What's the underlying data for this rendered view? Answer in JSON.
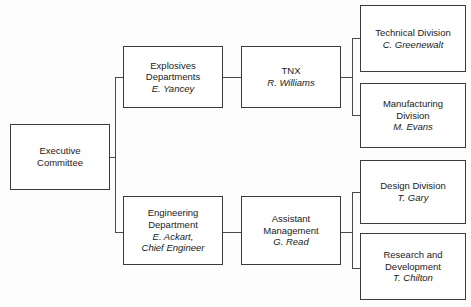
{
  "chart_data": {
    "type": "diagram",
    "diagram_kind": "organizational-chart",
    "title": "",
    "orientation": "left-to-right",
    "levels": 4,
    "nodes": [
      {
        "id": "executive-committee",
        "lines": [
          {
            "text": "Executive",
            "style": "regular"
          },
          {
            "text": "Committee",
            "style": "regular"
          }
        ],
        "level": 1,
        "box": {
          "x": 10,
          "y": 124,
          "w": 100,
          "h": 66
        }
      },
      {
        "id": "explosives-departments",
        "lines": [
          {
            "text": "Explosives",
            "style": "regular"
          },
          {
            "text": "Departments",
            "style": "regular"
          },
          {
            "text": "E. Yancey",
            "style": "italic"
          }
        ],
        "level": 2,
        "box": {
          "x": 123,
          "y": 46,
          "w": 100,
          "h": 62
        }
      },
      {
        "id": "engineering-department",
        "lines": [
          {
            "text": "Engineering",
            "style": "regular"
          },
          {
            "text": "Department",
            "style": "regular"
          },
          {
            "text": "E. Ackart,",
            "style": "italic"
          },
          {
            "text": "Chief Engineer",
            "style": "italic"
          }
        ],
        "level": 2,
        "box": {
          "x": 123,
          "y": 196,
          "w": 100,
          "h": 69
        }
      },
      {
        "id": "tnx",
        "lines": [
          {
            "text": "TNX",
            "style": "regular"
          },
          {
            "text": "R. Williams",
            "style": "italic"
          }
        ],
        "level": 3,
        "box": {
          "x": 241,
          "y": 46,
          "w": 100,
          "h": 62
        }
      },
      {
        "id": "assistant-management",
        "lines": [
          {
            "text": "Assistant",
            "style": "regular"
          },
          {
            "text": "Management",
            "style": "regular"
          },
          {
            "text": "G. Read",
            "style": "italic"
          }
        ],
        "level": 3,
        "box": {
          "x": 241,
          "y": 196,
          "w": 100,
          "h": 69
        }
      },
      {
        "id": "technical-division",
        "lines": [
          {
            "text": "Technical Division",
            "style": "regular"
          },
          {
            "text": "C. Greenewalt",
            "style": "italic"
          }
        ],
        "level": 4,
        "box": {
          "x": 360,
          "y": 5,
          "w": 106,
          "h": 67
        }
      },
      {
        "id": "manufacturing-division",
        "lines": [
          {
            "text": "Manufacturing",
            "style": "regular"
          },
          {
            "text": "Division",
            "style": "regular"
          },
          {
            "text": "M. Evans",
            "style": "italic"
          }
        ],
        "level": 4,
        "box": {
          "x": 360,
          "y": 83,
          "w": 106,
          "h": 65
        }
      },
      {
        "id": "design-division",
        "lines": [
          {
            "text": "Design Division",
            "style": "regular"
          },
          {
            "text": "T. Gary",
            "style": "italic"
          }
        ],
        "level": 4,
        "box": {
          "x": 360,
          "y": 160,
          "w": 106,
          "h": 64
        }
      },
      {
        "id": "research-and-development",
        "lines": [
          {
            "text": "Research and",
            "style": "regular"
          },
          {
            "text": "Development",
            "style": "regular"
          },
          {
            "text": "T. Chilton",
            "style": "italic"
          }
        ],
        "level": 4,
        "box": {
          "x": 360,
          "y": 233,
          "w": 106,
          "h": 67
        }
      }
    ],
    "edges": [
      {
        "from": "executive-committee",
        "to": "explosives-departments"
      },
      {
        "from": "executive-committee",
        "to": "engineering-department"
      },
      {
        "from": "explosives-departments",
        "to": "tnx"
      },
      {
        "from": "engineering-department",
        "to": "assistant-management"
      },
      {
        "from": "tnx",
        "to": "technical-division"
      },
      {
        "from": "tnx",
        "to": "manufacturing-division"
      },
      {
        "from": "assistant-management",
        "to": "design-division"
      },
      {
        "from": "assistant-management",
        "to": "research-and-development"
      }
    ],
    "connector_segments": [
      {
        "id": "exec-stub",
        "type": "h",
        "x": 110,
        "y": 157,
        "len": 6
      },
      {
        "id": "exec-trunk",
        "type": "v",
        "x": 115,
        "y": 77,
        "len": 156
      },
      {
        "id": "exec-to-explos",
        "type": "h",
        "x": 115,
        "y": 77,
        "len": 9
      },
      {
        "id": "exec-to-engin",
        "type": "h",
        "x": 115,
        "y": 232,
        "len": 9
      },
      {
        "id": "explos-to-tnx",
        "type": "h",
        "x": 223,
        "y": 77,
        "len": 18
      },
      {
        "id": "engin-to-asst",
        "type": "h",
        "x": 223,
        "y": 232,
        "len": 18
      },
      {
        "id": "tnx-stub",
        "type": "h",
        "x": 341,
        "y": 77,
        "len": 12
      },
      {
        "id": "tnx-trunk",
        "type": "v",
        "x": 352,
        "y": 38,
        "len": 78
      },
      {
        "id": "tnx-to-tech",
        "type": "h",
        "x": 352,
        "y": 38,
        "len": 9
      },
      {
        "id": "tnx-to-manu",
        "type": "h",
        "x": 352,
        "y": 115,
        "len": 9
      },
      {
        "id": "asst-stub",
        "type": "h",
        "x": 341,
        "y": 232,
        "len": 12
      },
      {
        "id": "asst-trunk",
        "type": "v",
        "x": 352,
        "y": 192,
        "len": 77
      },
      {
        "id": "asst-to-design",
        "type": "h",
        "x": 352,
        "y": 192,
        "len": 9
      },
      {
        "id": "asst-to-research",
        "type": "h",
        "x": 352,
        "y": 268,
        "len": 9
      }
    ],
    "colors": {
      "background": "#fdfdfd",
      "box_fill": "#ffffff",
      "box_border": "#3b3b3b",
      "connector": "#4a4a4a",
      "text": "#1a1a1a"
    }
  }
}
